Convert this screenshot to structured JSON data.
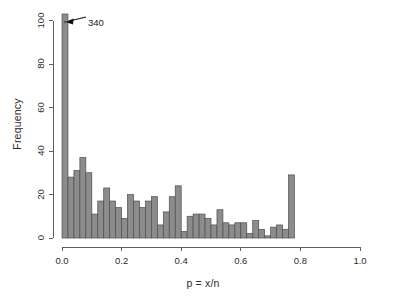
{
  "chart_data": {
    "type": "bar",
    "title": "",
    "xlabel": "p = x/n",
    "ylabel": "Frequency",
    "xlim": [
      0,
      1
    ],
    "ylim": [
      0,
      103
    ],
    "grid": false,
    "legend": null,
    "bin_width": 0.02,
    "x_ticks": [
      0.0,
      0.2,
      0.4,
      0.6,
      0.8,
      1.0
    ],
    "x_tick_labels": [
      "0.0",
      "0.2",
      "0.4",
      "0.6",
      "0.8",
      "1.0"
    ],
    "y_ticks": [
      0,
      20,
      40,
      60,
      80,
      100
    ],
    "y_tick_labels": [
      "0",
      "20",
      "40",
      "60",
      "80",
      "100"
    ],
    "bar_color": "#8c8c8c",
    "bar_edge_color": "#4d4d4d",
    "axis_color": "#4d4d4d",
    "categories": [
      "0.00",
      "0.02",
      "0.04",
      "0.06",
      "0.08",
      "0.10",
      "0.12",
      "0.14",
      "0.16",
      "0.18",
      "0.20",
      "0.22",
      "0.24",
      "0.26",
      "0.28",
      "0.30",
      "0.32",
      "0.34",
      "0.36",
      "0.38",
      "0.40",
      "0.42",
      "0.44",
      "0.46",
      "0.48",
      "0.50",
      "0.52",
      "0.54",
      "0.56",
      "0.58",
      "0.60",
      "0.62",
      "0.64",
      "0.66",
      "0.68",
      "0.70",
      "0.72",
      "0.74",
      "0.76",
      "0.78",
      "0.80",
      "0.82",
      "0.84",
      "0.86",
      "0.88",
      "0.90",
      "0.92",
      "0.94",
      "0.96",
      "0.98"
    ],
    "values": [
      103,
      28,
      31,
      37,
      30,
      11,
      17,
      23,
      17,
      14,
      9,
      20,
      17,
      14,
      17,
      19,
      6,
      12,
      19,
      24,
      3,
      10,
      11,
      11,
      9,
      6,
      13,
      7,
      6,
      7,
      7,
      2,
      8,
      4,
      1,
      5,
      6,
      4,
      29,
      0,
      0,
      0,
      0,
      0,
      0,
      0,
      0,
      0,
      0,
      0
    ],
    "annotation": {
      "text": "340",
      "target_bin": "0.00",
      "true_value": 340,
      "note": "first bar truncated at axis top"
    }
  },
  "axes": {
    "y_title": "Frequency",
    "x_title": "p = x/n"
  }
}
